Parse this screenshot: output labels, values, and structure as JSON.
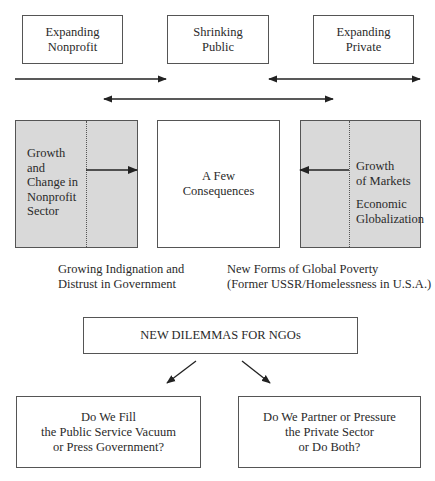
{
  "top_boxes": [
    {
      "lines": [
        "Expanding",
        "Nonprofit"
      ]
    },
    {
      "lines": [
        "Shrinking",
        "Public"
      ]
    },
    {
      "lines": [
        "Expanding",
        "Private"
      ]
    }
  ],
  "left_panel": {
    "lines": [
      "Growth",
      "and",
      "Change in",
      "Nonprofit",
      "Sector"
    ]
  },
  "center_box": {
    "lines": [
      "A Few",
      "Consequences"
    ]
  },
  "right_panel": {
    "group1": [
      "Growth",
      "of Markets"
    ],
    "group2": [
      "Economic",
      "Globalization"
    ]
  },
  "captions": {
    "left": [
      "Growing Indignation and",
      "Distrust in Government"
    ],
    "right": [
      "New Forms of Global Poverty",
      "(Former USSR/Homelessness in U.S.A.)"
    ]
  },
  "dilemma_box": {
    "label": "NEW DILEMMAS FOR NGOs"
  },
  "bottom_boxes": [
    {
      "lines": [
        "Do We Fill",
        "the Public Service Vacuum",
        "or Press Government?"
      ]
    },
    {
      "lines": [
        "Do We Partner or Pressure",
        "the Private Sector",
        "or Do Both?"
      ]
    }
  ],
  "colors": {
    "panel_fill": "#d9d9d9",
    "border": "#555555",
    "arrow": "#222222"
  }
}
